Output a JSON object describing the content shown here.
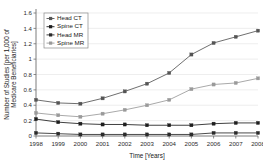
{
  "chart_data": {
    "type": "line",
    "title": "",
    "xlabel": "Time [Years]",
    "ylabel": "Number of Studies [per 1,000 of Medicare Beneficiaries]",
    "ylabel_line1": "Number of Studies [per 1,000 of",
    "ylabel_line2": "Medicare Beneficiaries]",
    "categories": [
      "1998",
      "1999",
      "2000",
      "2001",
      "2002",
      "2003",
      "2004",
      "2005",
      "2006",
      "2007",
      "2008"
    ],
    "x": [
      1998,
      1999,
      2000,
      2001,
      2002,
      2003,
      2004,
      2005,
      2006,
      2007,
      2008
    ],
    "xlim": [
      1998,
      2008
    ],
    "ylim": [
      0,
      1.6
    ],
    "yticks": [
      "0",
      "0.2",
      "0.4",
      "0.6",
      "0.8",
      "1",
      "1.2",
      "1.4",
      "1.6"
    ],
    "ytick_values": [
      0,
      0.2,
      0.4,
      0.6,
      0.8,
      1.0,
      1.2,
      1.4,
      1.6
    ],
    "grid": true,
    "legend_position": "top-left",
    "marker": "square",
    "series": [
      {
        "name": "Head CT",
        "color": "#555555",
        "values": [
          0.47,
          0.43,
          0.42,
          0.49,
          0.58,
          0.68,
          0.82,
          1.06,
          1.21,
          1.29,
          1.37
        ]
      },
      {
        "name": "Spine CT",
        "color": "#1e1e1e",
        "values": [
          0.22,
          0.18,
          0.16,
          0.15,
          0.15,
          0.14,
          0.14,
          0.14,
          0.16,
          0.17,
          0.17
        ]
      },
      {
        "name": "Head MR",
        "color": "#2b2b2b",
        "values": [
          0.04,
          0.03,
          0.02,
          0.02,
          0.02,
          0.02,
          0.02,
          0.02,
          0.04,
          0.04,
          0.04
        ]
      },
      {
        "name": "Spine MR",
        "color": "#9a9a9a",
        "values": [
          0.3,
          0.27,
          0.25,
          0.29,
          0.34,
          0.4,
          0.47,
          0.61,
          0.67,
          0.69,
          0.75
        ]
      }
    ]
  },
  "legend": {
    "items": [
      {
        "label": "Head CT"
      },
      {
        "label": "Spine CT"
      },
      {
        "label": "Head MR"
      },
      {
        "label": "Spine MR"
      }
    ]
  },
  "colors": {
    "background": "#ffffff",
    "axis": "#6e6e6e",
    "grid": "#e2e2e2",
    "text": "#1a1a1a"
  }
}
